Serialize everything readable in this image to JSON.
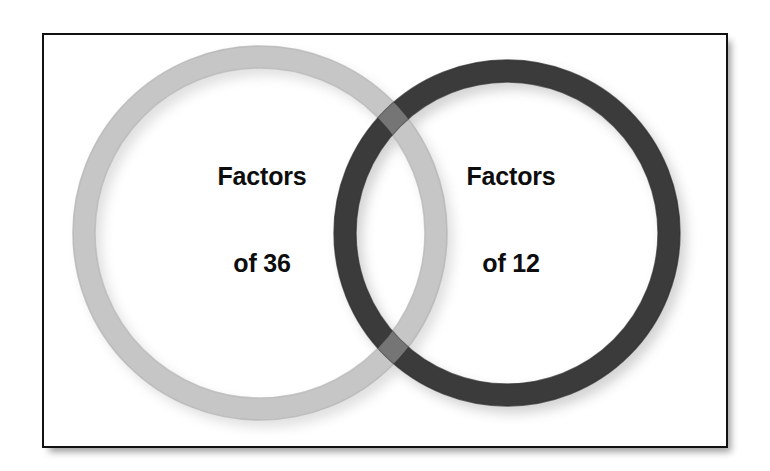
{
  "diagram": {
    "type": "venn",
    "background_color": "#ffffff",
    "frame": {
      "name": "diagram-frame",
      "border_color": "#111111",
      "fill_color": "#ffffff",
      "shadow": "drop-shadow-bottom-right"
    },
    "circles": [
      {
        "id": "left",
        "label_line1": "Factors",
        "label_line2": "of 36",
        "color": "#c6c6c6",
        "stroke_width": 22,
        "cx": 260,
        "cy": 233,
        "r": 176,
        "z": 1
      },
      {
        "id": "right",
        "label_line1": "Factors",
        "label_line2": "of 12",
        "color": "#3b3b3b",
        "stroke_width": 22,
        "cx": 507,
        "cy": 233,
        "r": 162,
        "z": 2
      }
    ],
    "overlap": {
      "name": "ring-intersection",
      "color": "#5e5e5e",
      "description": "upper and lower crossing patches where the two ring bands intersect"
    },
    "labels": {
      "left": {
        "line1": "Factors",
        "line2": "of 36"
      },
      "right": {
        "line1": "Factors",
        "line2": "of 12"
      }
    },
    "text_color": "#0d0d0d"
  }
}
